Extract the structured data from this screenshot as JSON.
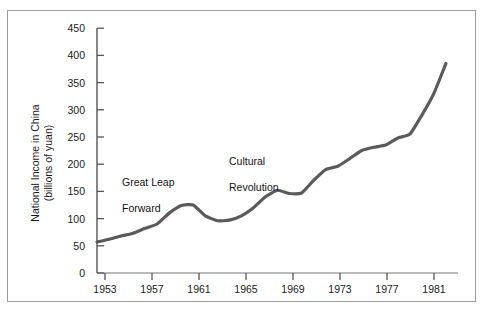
{
  "chart_data": {
    "type": "line",
    "title": "",
    "subtitle": "",
    "xlabel": "",
    "ylabel": "National Income in China\n(billions of yuan)",
    "ylabel_line1": "National Income in China",
    "ylabel_line2": "(billions of yuan)",
    "xlim": [
      1952,
      1982
    ],
    "ylim": [
      0,
      450
    ],
    "grid": false,
    "legend": false,
    "legend_position": "none",
    "line_color": "#5a5a5a",
    "axis_color": "#555555",
    "frame_color": "#9a9a9a",
    "text_color": "#1a1a1a",
    "yticks": [
      0,
      50,
      100,
      150,
      200,
      250,
      300,
      350,
      400,
      450
    ],
    "ytick_labels": [
      "0",
      "50",
      "100",
      "150",
      "200",
      "250",
      "300",
      "350",
      "400",
      "450"
    ],
    "xticks": [
      1953,
      1957,
      1961,
      1965,
      1969,
      1973,
      1977,
      1981
    ],
    "xtick_labels": [
      "1953",
      "1957",
      "1961",
      "1965",
      "1969",
      "1973",
      "1977",
      "1981"
    ],
    "series": [
      {
        "name": "National Income in China",
        "x": [
          1952,
          1953,
          1954,
          1955,
          1956,
          1957,
          1958,
          1959,
          1960,
          1961,
          1962,
          1963,
          1964,
          1965,
          1966,
          1967,
          1968,
          1969,
          1970,
          1971,
          1972,
          1973,
          1974,
          1975,
          1976,
          1977,
          1978,
          1979,
          1980,
          1981
        ],
        "values": [
          57,
          62,
          68,
          73,
          82,
          90,
          110,
          124,
          125,
          105,
          96,
          97,
          105,
          120,
          140,
          152,
          146,
          147,
          170,
          190,
          196,
          210,
          225,
          231,
          235,
          248,
          255,
          290,
          330,
          385
        ]
      }
    ],
    "annotations": [
      {
        "id": "great-leap-forward",
        "text": "Great Leap\nForward",
        "line1": "Great Leap",
        "line2": "Forward",
        "x": 1957.2,
        "y": 175
      },
      {
        "id": "cultural-revolution",
        "text": "Cultural\nRevolution",
        "line1": "Cultural",
        "line2": "Revolution",
        "x": 1966.2,
        "y": 210
      }
    ]
  }
}
